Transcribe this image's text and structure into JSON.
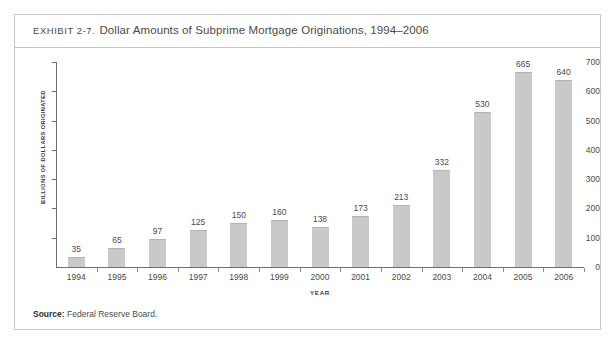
{
  "exhibit": {
    "label": "EXHIBIT 2-7.",
    "title": "Dollar Amounts of Subprime Mortgage Originations, 1994–2006",
    "source_label": "Source:",
    "source_text": "Federal Reserve Board.",
    "border_color": "#c6c6c6"
  },
  "chart_data": {
    "type": "bar",
    "title": "Dollar Amounts of Subprime Mortgage Originations, 1994–2006",
    "xlabel": "YEAR",
    "ylabel": "BILLIONS OF DOLLARS ORIGINATED",
    "categories": [
      "1994",
      "1995",
      "1996",
      "1997",
      "1998",
      "1999",
      "2000",
      "2001",
      "2002",
      "2003",
      "2004",
      "2005",
      "2006"
    ],
    "values": [
      35,
      65,
      97,
      125,
      150,
      160,
      138,
      173,
      213,
      332,
      530,
      665,
      640
    ],
    "ylim": [
      0,
      700
    ],
    "yticks": [
      0,
      100,
      200,
      300,
      400,
      500,
      600,
      700
    ],
    "ytick_labels": [
      "0",
      "100",
      "200",
      "300",
      "400",
      "500",
      "600",
      "700"
    ],
    "grid": false,
    "legend": false,
    "bar_color": "#c9c9c9",
    "axis_color": "#6e6e6e",
    "data_labels": [
      "35",
      "65",
      "97",
      "125",
      "150",
      "160",
      "138",
      "173",
      "213",
      "332",
      "530",
      "665",
      "640"
    ]
  }
}
